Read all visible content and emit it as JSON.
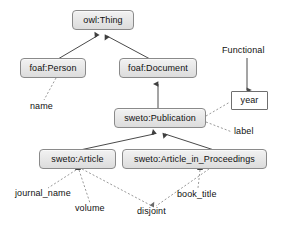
{
  "diagram": {
    "background_color": "#ffffff",
    "node_fill_color": "#e6e6e6",
    "node_border_color": "#8a8a8a",
    "datatype_fill_color": "#ffffff",
    "edge_color": "#4a4a4a",
    "dashed_edge_color": "#9a9a9a",
    "nodes": {
      "owl_thing": "owl:Thing",
      "foaf_person": "foaf:Person",
      "foaf_document": "foaf:Document",
      "sweto_publication": "sweto:Publication",
      "sweto_article": "sweto:Article",
      "sweto_article_in_proceedings": "sweto:Article_in_Proceedings",
      "year": "year"
    },
    "labels": {
      "functional": "Functional",
      "name": "name",
      "label": "label",
      "journal_name": "journal_name",
      "volume": "volume",
      "disjoint": "disjoint",
      "book_title": "book_title"
    }
  }
}
